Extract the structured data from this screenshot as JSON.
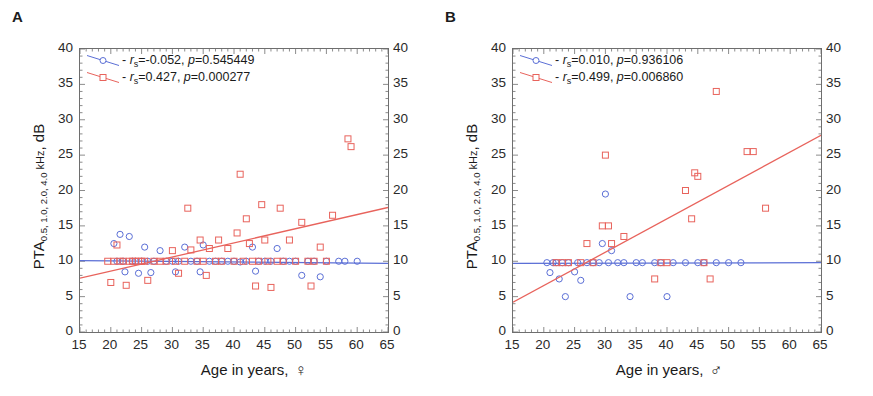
{
  "figure": {
    "panels": [
      {
        "letter": "A",
        "name": "female",
        "ylabel_main": "PTA",
        "ylabel_sub": "0.5, 1.0, 2.0, 4.0",
        "ylabel_khz": " kHz",
        "ylabel_unit": ", dB",
        "xlabel": "Age in years,",
        "sex_symbol": "♀",
        "legend": [
          {
            "series": "blue",
            "color": "#5b6fd6",
            "marker": "circle",
            "stat_label": "r",
            "stat_sub": "s",
            "r_text": "=-0.052,",
            "p_label": "p",
            "p_text": "=0.545449",
            "r_value": -0.052,
            "p_value": 0.545449
          },
          {
            "series": "red",
            "color": "#e8635c",
            "marker": "square",
            "stat_label": "r",
            "stat_sub": "s",
            "r_text": "=0.427,",
            "p_label": "p",
            "p_text": "=0.000277",
            "r_value": 0.427,
            "p_value": 0.000277
          }
        ]
      },
      {
        "letter": "B",
        "name": "male",
        "ylabel_main": "PTA",
        "ylabel_sub": "0.5, 1.0, 2.0, 4.0",
        "ylabel_khz": " kHz",
        "ylabel_unit": ", dB",
        "xlabel": "Age in years,",
        "sex_symbol": "♂",
        "legend": [
          {
            "series": "blue",
            "color": "#5b6fd6",
            "marker": "circle",
            "stat_label": "r",
            "stat_sub": "s",
            "r_text": "=0.010,",
            "p_label": "p",
            "p_text": "=0.936106",
            "r_value": 0.01,
            "p_value": 0.936106
          },
          {
            "series": "red",
            "color": "#e8635c",
            "marker": "square",
            "stat_label": "r",
            "stat_sub": "s",
            "r_text": "=0.499,",
            "p_label": "p",
            "p_text": "=0.006860",
            "r_value": 0.499,
            "p_value": 0.00686
          }
        ]
      }
    ]
  },
  "chart_data": [
    {
      "type": "scatter",
      "panel": "A",
      "title": "A",
      "xlabel": "Age in years, ♀",
      "ylabel": "PTA0.5, 1.0, 2.0, 4.0 kHz, dB",
      "xlim": [
        15,
        65
      ],
      "ylim": [
        0,
        40
      ],
      "xticks": [
        15,
        20,
        25,
        30,
        35,
        40,
        45,
        50,
        55,
        60,
        65
      ],
      "yticks": [
        0,
        5,
        10,
        15,
        20,
        25,
        30,
        35,
        40
      ],
      "grid": false,
      "dual_y_axis": true,
      "legend_position": "top-left",
      "series": [
        {
          "name": "blue",
          "marker": "circle",
          "color": "#5b6fd6",
          "regression": {
            "x": [
              15,
              65
            ],
            "y": [
              10.1,
              9.7
            ]
          },
          "points": [
            [
              20.5,
              12.5
            ],
            [
              21.0,
              10.0
            ],
            [
              21.5,
              13.8
            ],
            [
              22.0,
              10.0
            ],
            [
              22.3,
              8.5
            ],
            [
              23.0,
              13.5
            ],
            [
              23.5,
              10.0
            ],
            [
              24.0,
              10.0
            ],
            [
              24.5,
              8.3
            ],
            [
              25.0,
              10.0
            ],
            [
              25.5,
              12.0
            ],
            [
              26.0,
              10.0
            ],
            [
              26.5,
              8.4
            ],
            [
              27.0,
              10.0
            ],
            [
              28.0,
              11.5
            ],
            [
              29.0,
              10.0
            ],
            [
              30.0,
              10.0
            ],
            [
              30.5,
              8.5
            ],
            [
              31.0,
              10.0
            ],
            [
              32.0,
              12.0
            ],
            [
              33.0,
              10.0
            ],
            [
              34.0,
              10.0
            ],
            [
              34.5,
              8.5
            ],
            [
              35.0,
              12.3
            ],
            [
              36.0,
              10.0
            ],
            [
              37.0,
              10.0
            ],
            [
              38.0,
              10.0
            ],
            [
              39.0,
              10.0
            ],
            [
              40.0,
              10.0
            ],
            [
              41.0,
              9.9
            ],
            [
              42.0,
              10.0
            ],
            [
              43.0,
              12.0
            ],
            [
              43.5,
              8.6
            ],
            [
              44.0,
              10.0
            ],
            [
              45.0,
              10.0
            ],
            [
              46.0,
              10.0
            ],
            [
              47.0,
              11.8
            ],
            [
              48.0,
              10.0
            ],
            [
              49.0,
              10.0
            ],
            [
              50.0,
              10.0
            ],
            [
              51.0,
              8.0
            ],
            [
              52.0,
              10.0
            ],
            [
              53.0,
              10.0
            ],
            [
              54.0,
              7.8
            ],
            [
              55.0,
              10.0
            ],
            [
              57.0,
              10.0
            ],
            [
              58.0,
              10.0
            ],
            [
              60.0,
              10.0
            ]
          ]
        },
        {
          "name": "red",
          "marker": "square",
          "color": "#e8635c",
          "regression": {
            "x": [
              15,
              65
            ],
            "y": [
              7.6,
              17.6
            ]
          },
          "points": [
            [
              19.5,
              10.0
            ],
            [
              20.0,
              7.0
            ],
            [
              20.5,
              10.0
            ],
            [
              21.0,
              12.3
            ],
            [
              21.5,
              10.0
            ],
            [
              22.0,
              10.0
            ],
            [
              22.5,
              6.6
            ],
            [
              23.0,
              10.0
            ],
            [
              23.5,
              10.0
            ],
            [
              24.0,
              10.0
            ],
            [
              24.5,
              10.0
            ],
            [
              25.0,
              10.0
            ],
            [
              25.5,
              10.0
            ],
            [
              26.0,
              7.3
            ],
            [
              27.0,
              10.0
            ],
            [
              28.0,
              10.0
            ],
            [
              29.0,
              10.0
            ],
            [
              30.0,
              11.5
            ],
            [
              30.5,
              10.0
            ],
            [
              31.0,
              8.3
            ],
            [
              32.0,
              10.0
            ],
            [
              32.5,
              17.5
            ],
            [
              33.0,
              11.6
            ],
            [
              34.0,
              10.0
            ],
            [
              34.5,
              13.0
            ],
            [
              35.0,
              10.0
            ],
            [
              35.5,
              8.0
            ],
            [
              36.0,
              11.8
            ],
            [
              37.0,
              10.0
            ],
            [
              37.5,
              13.0
            ],
            [
              38.0,
              10.0
            ],
            [
              39.0,
              11.8
            ],
            [
              40.0,
              10.0
            ],
            [
              40.5,
              14.0
            ],
            [
              41.0,
              22.3
            ],
            [
              41.5,
              10.0
            ],
            [
              42.0,
              16.0
            ],
            [
              42.5,
              12.5
            ],
            [
              43.0,
              10.0
            ],
            [
              43.5,
              6.5
            ],
            [
              44.0,
              10.0
            ],
            [
              44.5,
              18.0
            ],
            [
              45.0,
              13.0
            ],
            [
              45.5,
              10.0
            ],
            [
              46.0,
              6.3
            ],
            [
              47.0,
              10.0
            ],
            [
              47.5,
              17.5
            ],
            [
              48.0,
              10.0
            ],
            [
              49.0,
              13.0
            ],
            [
              50.0,
              10.0
            ],
            [
              51.0,
              15.5
            ],
            [
              52.0,
              10.0
            ],
            [
              52.5,
              6.5
            ],
            [
              53.0,
              10.0
            ],
            [
              54.0,
              12.0
            ],
            [
              55.0,
              10.0
            ],
            [
              56.0,
              16.5
            ],
            [
              58.5,
              27.3
            ],
            [
              59.0,
              26.2
            ]
          ]
        }
      ]
    },
    {
      "type": "scatter",
      "panel": "B",
      "title": "B",
      "xlabel": "Age in years, ♂",
      "ylabel": "PTA0.5, 1.0, 2.0, 4.0 kHz, dB",
      "xlim": [
        15,
        65
      ],
      "ylim": [
        0,
        40
      ],
      "xticks": [
        15,
        20,
        25,
        30,
        35,
        40,
        45,
        50,
        55,
        60,
        65
      ],
      "yticks": [
        0,
        5,
        10,
        15,
        20,
        25,
        30,
        35,
        40
      ],
      "grid": false,
      "dual_y_axis": true,
      "legend_position": "top-left",
      "series": [
        {
          "name": "blue",
          "marker": "circle",
          "color": "#5b6fd6",
          "regression": {
            "x": [
              15,
              65
            ],
            "y": [
              9.7,
              9.8
            ]
          },
          "points": [
            [
              20.5,
              9.8
            ],
            [
              21.0,
              8.4
            ],
            [
              21.5,
              9.8
            ],
            [
              22.0,
              9.8
            ],
            [
              22.5,
              7.5
            ],
            [
              23.0,
              9.8
            ],
            [
              23.5,
              5.0
            ],
            [
              24.0,
              9.8
            ],
            [
              25.0,
              8.5
            ],
            [
              25.5,
              9.8
            ],
            [
              26.0,
              7.3
            ],
            [
              27.0,
              9.8
            ],
            [
              28.0,
              9.8
            ],
            [
              29.0,
              9.8
            ],
            [
              29.5,
              12.5
            ],
            [
              30.0,
              19.5
            ],
            [
              30.5,
              9.8
            ],
            [
              31.0,
              11.5
            ],
            [
              32.0,
              9.8
            ],
            [
              33.0,
              9.8
            ],
            [
              34.0,
              5.0
            ],
            [
              35.0,
              9.8
            ],
            [
              36.0,
              9.8
            ],
            [
              38.0,
              9.8
            ],
            [
              39.0,
              9.8
            ],
            [
              40.0,
              5.0
            ],
            [
              41.0,
              9.8
            ],
            [
              43.0,
              9.8
            ],
            [
              45.0,
              9.8
            ],
            [
              46.0,
              9.8
            ],
            [
              48.0,
              9.8
            ],
            [
              50.0,
              9.8
            ],
            [
              52.0,
              9.8
            ]
          ]
        },
        {
          "name": "red",
          "marker": "square",
          "color": "#e8635c",
          "regression": {
            "x": [
              15,
              65
            ],
            "y": [
              4.2,
              27.8
            ]
          },
          "points": [
            [
              22.0,
              9.8
            ],
            [
              23.0,
              9.8
            ],
            [
              24.0,
              9.8
            ],
            [
              26.0,
              9.8
            ],
            [
              27.0,
              12.5
            ],
            [
              28.0,
              9.8
            ],
            [
              29.5,
              15.0
            ],
            [
              30.0,
              25.0
            ],
            [
              30.5,
              15.0
            ],
            [
              31.0,
              12.5
            ],
            [
              33.0,
              13.5
            ],
            [
              38.0,
              7.5
            ],
            [
              39.0,
              9.8
            ],
            [
              40.0,
              9.8
            ],
            [
              43.0,
              20.0
            ],
            [
              44.0,
              16.0
            ],
            [
              44.5,
              22.5
            ],
            [
              45.0,
              22.0
            ],
            [
              46.0,
              9.8
            ],
            [
              47.0,
              7.5
            ],
            [
              48.0,
              34.0
            ],
            [
              53.0,
              25.5
            ],
            [
              54.0,
              25.5
            ],
            [
              56.0,
              17.5
            ]
          ]
        }
      ]
    }
  ]
}
